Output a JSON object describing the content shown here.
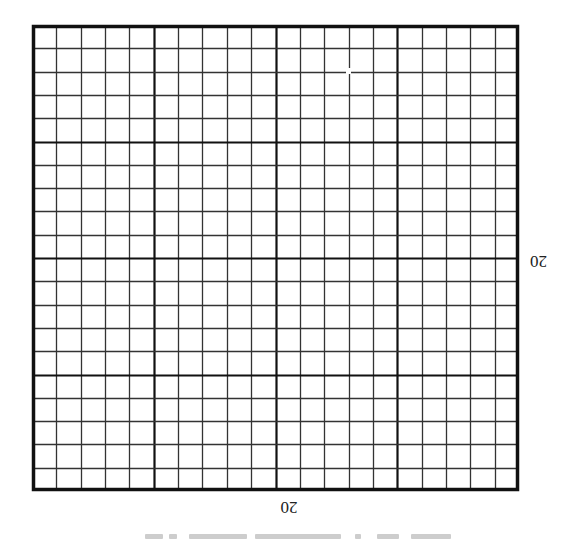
{
  "figure": {
    "type": "graph-paper-grid",
    "orientation": "rotated-180",
    "grid": {
      "columns": 20,
      "rows": 20,
      "major_every": 5,
      "line_color": "#333333",
      "major_line_color": "#111111",
      "border_color": "#111111",
      "background": "#ffffff"
    },
    "labels": {
      "horizontal_dimension": "20",
      "vertical_dimension": "20"
    }
  }
}
